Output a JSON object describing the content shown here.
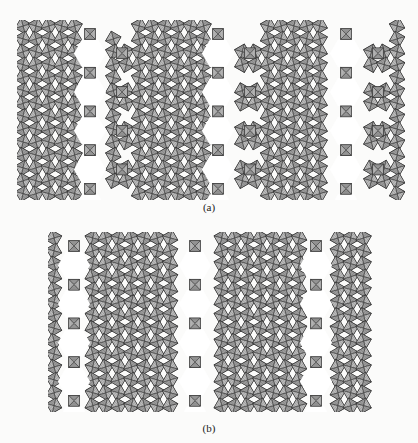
{
  "figure": {
    "background": "#fbfbfa",
    "octahedron_fill": "#8a8a8a",
    "octahedron_light": "#cfcfcf",
    "octahedron_edge": "#2b2b2b",
    "channel_fill": "#ffffff"
  },
  "panels": [
    {
      "id": "a",
      "caption": "(a)",
      "caption_x": 209,
      "caption_y": 201,
      "x": 17,
      "y": 20,
      "width": 388,
      "height": 180,
      "cell": 12.9,
      "hex_columns_x": [
        90,
        218,
        346
      ],
      "hex_rows_y": [
        32,
        70,
        108,
        146
      ],
      "hex_offset_rows_y": [
        51,
        89,
        127,
        165
      ],
      "hex_offset_columns_x": [
        122,
        250,
        378
      ],
      "notch_columns_x": [
        122,
        250,
        378
      ]
    },
    {
      "id": "b",
      "caption": "(b)",
      "caption_x": 209,
      "caption_y": 422,
      "x": 48,
      "y": 232,
      "width": 330,
      "height": 180,
      "cell": 12.9,
      "hex_columns_x": [
        74,
        195,
        316
      ],
      "hex_rows_y": [
        32,
        70,
        108,
        146
      ],
      "hex_offset_rows_y": [],
      "hex_offset_columns_x": [],
      "notch_columns_x": []
    }
  ]
}
